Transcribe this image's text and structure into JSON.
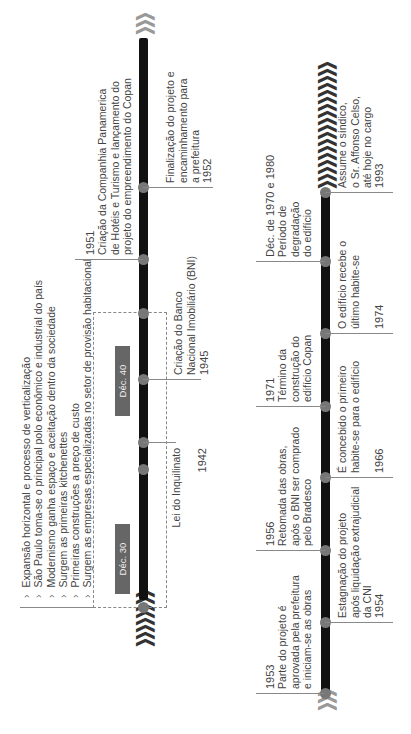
{
  "figure": {
    "orientation": "rotated-90-ccw",
    "top_timeline": {
      "start_chevrons": "❯❯❯❯❯❯❯❯",
      "end_chevrons": "❯❯❯",
      "period_labels": [
        "Déc. 30",
        "Déc. 40"
      ],
      "bullets": [
        "Expansão horizontal e processo de verticalização",
        "São Paulo toma-se o principal polo econômico e industrial do país",
        "Modernismo ganha espaço e aceitação dentro da sociedade",
        "Surgem as primeiras kitchenettes",
        "Primeiras construções a preço de custo",
        "Surgem as empresas especializadas no setor de provisão habitacional"
      ],
      "events": [
        {
          "year": "1942",
          "text": "Lei do Inquilinato"
        },
        {
          "year": "1945",
          "text": "Criação do Banco\nNacional Imobiliário (BNI)"
        },
        {
          "year": "1951",
          "text": "Criação da Companhia Panamerica\nde Hotéis e Turismo e lançamento do\nprojeto do empreendimento do Copan"
        },
        {
          "year": "1952",
          "text": "Finalização do projeto e\nencaminhamento para\na prefeitura"
        }
      ]
    },
    "bottom_timeline": {
      "start_chevrons": "❯❯❯",
      "end_chevrons": "❯❯❯❯❯❯❯❯❯❯❯❯❯❯❯❯❯❯",
      "events": [
        {
          "year": "1953",
          "text": "Parte do projeto é\naprovada pela prefeitura\ne iniciam-se as obras"
        },
        {
          "year": "1954",
          "text": "Estagnação do projeto\napós liquidação extrajudicial\nda CNI"
        },
        {
          "year": "1956",
          "text": "Retomada das obras,\napós o BNI ser comprado\npelo Bradesco"
        },
        {
          "year": "1966",
          "text": "É concebido o primeiro\nhabite-se para o edifício"
        },
        {
          "year": "1971",
          "text": "Término da\nconstrução do\nedifício Copan"
        },
        {
          "year": "1974",
          "text": "O edifício recebe o\núltimo habite-se"
        },
        {
          "year": "Déc. de 1970 e 1980",
          "text": "Período de\ndegradação\ndo edifício"
        },
        {
          "year": "1993",
          "text": "Assume o síndico,\no Sr. Affonso Celso,\naté hoje no cargo"
        }
      ]
    },
    "caption": "Figura — Linha do tempo do Edifício Copan"
  },
  "colors": {
    "bar": "#111111",
    "dot": "#777777",
    "period_box": "#666666",
    "text": "#444444",
    "connector": "#888888"
  }
}
